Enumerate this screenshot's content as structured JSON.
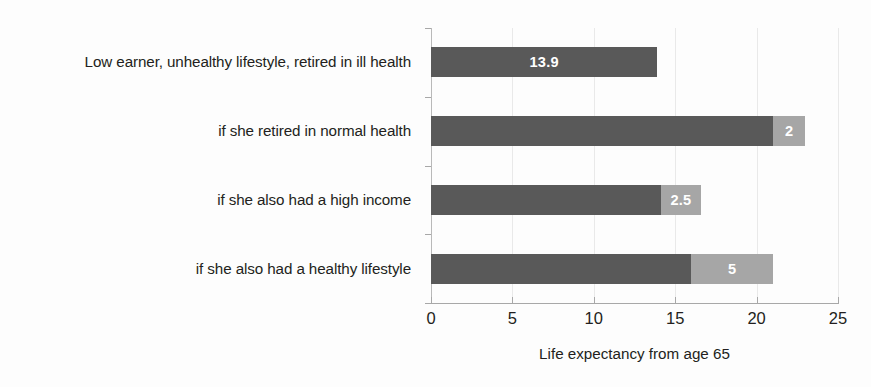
{
  "chart_data": {
    "type": "bar",
    "orientation": "horizontal",
    "stacked": true,
    "title": "",
    "xlabel": "Life expectancy from age 65",
    "ylabel": "",
    "xlim": [
      0,
      25
    ],
    "xticks": [
      0,
      5,
      10,
      15,
      20,
      25
    ],
    "xtick_labels": [
      "0",
      "5",
      "10",
      "15",
      "20",
      "25"
    ],
    "grid": true,
    "legend": "none",
    "categories": [
      "Low earner, unhealthy lifestyle, retired in ill health",
      "if she retired in normal health",
      "if she also had a high income",
      "if she also had a healthy lifestyle"
    ],
    "series": [
      {
        "name": "base",
        "color": "#595959",
        "values": [
          13.9,
          21.0,
          14.1,
          16.0
        ]
      },
      {
        "name": "increment",
        "color": "#a6a6a6",
        "values": [
          0,
          2,
          2.5,
          5
        ]
      }
    ],
    "bar_labels": [
      {
        "text": "13.9",
        "segment": "base",
        "category_index": 0
      },
      {
        "text": "2",
        "segment": "increment",
        "category_index": 1
      },
      {
        "text": "2.5",
        "segment": "increment",
        "category_index": 2
      },
      {
        "text": "5",
        "segment": "increment",
        "category_index": 3
      }
    ],
    "totals": [
      13.9,
      23.0,
      16.6,
      21.0
    ]
  },
  "colors": {
    "base_bar": "#595959",
    "increment_bar": "#a6a6a6",
    "gridline": "#e9e9e9",
    "axis": "#a8a8a8",
    "text": "#231f20",
    "value_label": "#ffffff",
    "background": "#fdfdfd"
  }
}
